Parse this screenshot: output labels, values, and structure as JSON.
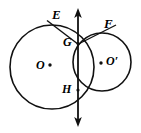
{
  "figure": {
    "stroke_color": "#111111",
    "background_color": "#ffffff",
    "labels": {
      "E": "E",
      "F": "F",
      "G": "G",
      "H": "H",
      "O": "O",
      "O_prime": "O′"
    },
    "points": [
      {
        "name": "E",
        "label": "E",
        "x": 58,
        "y": 19
      },
      {
        "name": "F",
        "label": "F",
        "x": 110,
        "y": 27
      },
      {
        "name": "G",
        "label": "G",
        "x": 78,
        "y": 43
      },
      {
        "name": "H",
        "label": "H",
        "x": 78,
        "y": 90
      },
      {
        "name": "O",
        "label": "O",
        "x": 52,
        "y": 67
      },
      {
        "name": "O_prime",
        "label": "O′",
        "x": 102,
        "y": 62
      }
    ],
    "circles": [
      {
        "name": "circle-O",
        "center_label": "O",
        "cx": 52,
        "cy": 67,
        "r": 42
      },
      {
        "name": "circle-O-prime",
        "center_label": "O′",
        "cx": 102,
        "cy": 62,
        "r": 29
      }
    ],
    "lines": [
      {
        "name": "common-chord-line",
        "kind": "double-arrow-vertical",
        "x": 78,
        "y1": 10,
        "y2": 125
      },
      {
        "name": "secant-E-G",
        "x1": 48,
        "y1": 21,
        "x2": 78,
        "y2": 44
      },
      {
        "name": "secant-G-F",
        "x1": 78,
        "y1": 44,
        "x2": 114,
        "y2": 26
      }
    ]
  }
}
